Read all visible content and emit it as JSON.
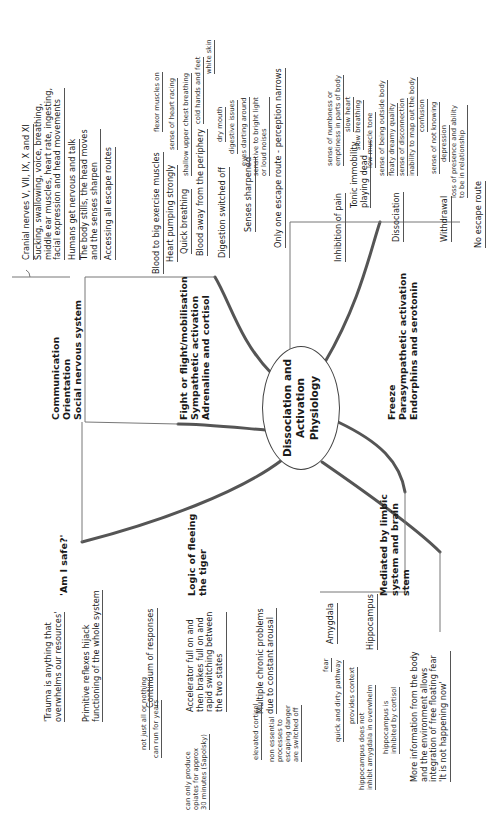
{
  "center": {
    "line1": "Dissociation and",
    "line2": "Activation Physiology"
  },
  "branches": {
    "communication": {
      "title": "Communication\nOrientation\nSocial nervous system",
      "children": [
        "Cranial nerves V, VII, IX, X and XI",
        "Sucking, swallowing, voice, breathing,\nmiddle ear muscles, heart rate, ingesting,\nfacial expression and head movements",
        "Humans get nervous and talk",
        "The body stills, the head moves\nand the senses sharpen",
        "Accessing all escape routes"
      ]
    },
    "fight": {
      "title": "Fight or flight/mobilisation\nSympathetic activation\nAdrenaline and cortisol",
      "children": [
        {
          "label": "Blood to big exercise muscles",
          "sub": [
            "flexor muscles on"
          ]
        },
        {
          "label": "Heart pumping strongly",
          "sub": [
            "sense of heart racing"
          ]
        },
        {
          "label": "Quick breathing",
          "sub": [
            "shallow upper chest breathing"
          ]
        },
        {
          "label": "Blood away from the periphery",
          "sub": [
            "cold hands and feet",
            "white skin"
          ]
        },
        {
          "label": "Digestion switched off",
          "sub": [
            "dry mouth",
            "digestive issues"
          ]
        },
        {
          "label": "Senses sharpened",
          "sub": [
            "eyes darting around",
            "sensitive to bright light\nor loud noises"
          ]
        },
        {
          "label": "Only one escape route - perception narrows",
          "sub": []
        }
      ]
    },
    "freeze": {
      "title": "Freeze\nParasympathetic activation\nEndorphins and serotonin",
      "children": [
        {
          "label": "Inhibition of pain",
          "sub": [
            "sense of numbness or\nemptiness in parts of body"
          ]
        },
        {
          "label": "Tonic immobility\nplaying dead",
          "sub": [
            "slow heart",
            "slow breathing",
            "low muscle tone"
          ]
        },
        {
          "label": "Dissociation",
          "sub": [
            "sense of being outside body",
            "floaty dreamy quality",
            "sense of disconnection",
            "inability to map out the body",
            "confusion"
          ]
        },
        {
          "label": "Withdrawal",
          "sub": [
            "sense of not knowing",
            "depression",
            "loss of presence and ability\nto be in relationship"
          ]
        },
        {
          "label": "No escape route",
          "sub": []
        }
      ]
    },
    "safe": {
      "title": "'Am I safe?'",
      "children": [
        "'Trauma is anything that\noverwhelms our resources'",
        "Primitive reflexes hijack\nfunctioning of the whole system"
      ]
    },
    "logic": {
      "title": "Logic of fleeing\nthe tiger",
      "children": [
        {
          "label": "Continuum of responses",
          "sub": [
            "not just all or nothing",
            "can run for years"
          ]
        },
        {
          "label": "Accelerator full on and\nthen brakes full on and\nrapid switching between\nthe two states",
          "sub": [
            "can only produce\nopiates for approx\n30 minutes (Sapolsky)"
          ]
        },
        {
          "label": "Multiple chronic problems\ndue to constant arousal",
          "sub": [
            "elevated cortisol",
            "non essential\nprocesses to\nescaping danger\nare switched off"
          ]
        }
      ]
    },
    "limbic": {
      "title": "Mediated by limbic\nsystem and brain\nstem",
      "children": [
        {
          "label": "Amygdala",
          "sub": [
            "fear",
            "quick and dirty pathway"
          ]
        },
        {
          "label": "Hippocampus",
          "sub": [
            "provides context",
            "hippocampus does not\ninhibit amygdala in overwhelm",
            "hippocampus is\ninhibited by cortisol"
          ]
        },
        {
          "label": "More information from the body\nand the environment allows\nintegration of free floating fear\n'It is not happening now'",
          "sub": []
        }
      ]
    }
  }
}
